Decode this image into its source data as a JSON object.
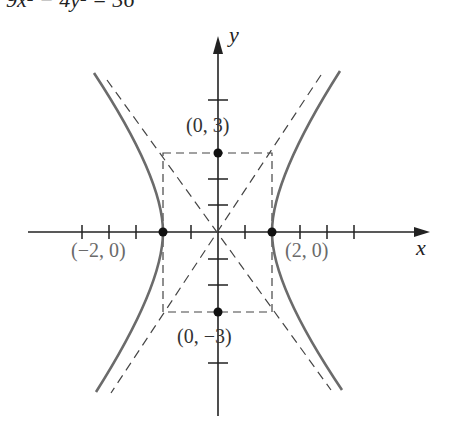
{
  "equation": "9x² − 4y² = 36",
  "axes": {
    "x_label": "x",
    "y_label": "y"
  },
  "points": [
    {
      "label": "(0, 3)",
      "x": 0,
      "y": 3
    },
    {
      "label": "(0, −3)",
      "x": 0,
      "y": -3
    },
    {
      "label": "(−2, 0)",
      "x": -2,
      "y": 0
    },
    {
      "label": "(2, 0)",
      "x": 2,
      "y": 0
    }
  ],
  "asymptotes": [
    "y = 3/2 x",
    "y = −3/2 x"
  ],
  "colors": {
    "curve": "#6b6b6b",
    "axis": "#222222",
    "dash": "#444444",
    "label": "#6a6a6a"
  }
}
